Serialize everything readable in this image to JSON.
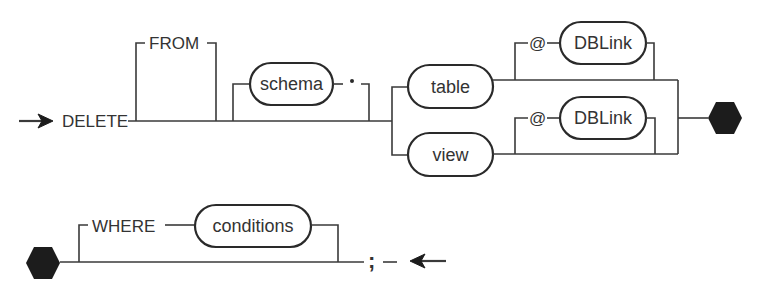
{
  "diagram": {
    "type": "railroad-syntax-diagram",
    "statement": "DELETE",
    "colors": {
      "line": "#3a3a3a",
      "connector": "#1c1c1c",
      "background": "#ffffff"
    },
    "row1": {
      "start_arrow": "arrow-right-icon",
      "keyword_delete": "DELETE",
      "optional_from": "FROM",
      "optional_schema": {
        "label": "schema",
        "separator": "."
      },
      "target_choices": [
        {
          "label": "table",
          "optional_dblink": {
            "prefix": "@",
            "label": "DBLink"
          }
        },
        {
          "label": "view",
          "optional_dblink": {
            "prefix": "@",
            "label": "DBLink"
          }
        }
      ],
      "continuation": "hexagon-connector"
    },
    "row2": {
      "continuation": "hexagon-connector",
      "optional_where": {
        "keyword": "WHERE",
        "label": "conditions"
      },
      "terminator": ";",
      "end_arrow": "arrow-left-icon"
    }
  }
}
